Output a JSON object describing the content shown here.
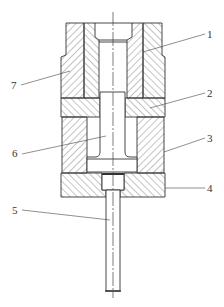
{
  "diagram": {
    "type": "mechanical-cross-section",
    "colors": {
      "line": "#333333",
      "hatch": "#555555",
      "background": "#ffffff"
    },
    "callouts": [
      {
        "id": "1",
        "label": "1",
        "side": "right"
      },
      {
        "id": "2",
        "label": "2",
        "side": "right"
      },
      {
        "id": "3",
        "label": "3",
        "side": "right"
      },
      {
        "id": "4",
        "label": "4",
        "side": "right"
      },
      {
        "id": "5",
        "label": "5",
        "side": "left"
      },
      {
        "id": "6",
        "label": "6",
        "side": "left"
      },
      {
        "id": "7",
        "label": "7",
        "side": "left"
      }
    ]
  }
}
